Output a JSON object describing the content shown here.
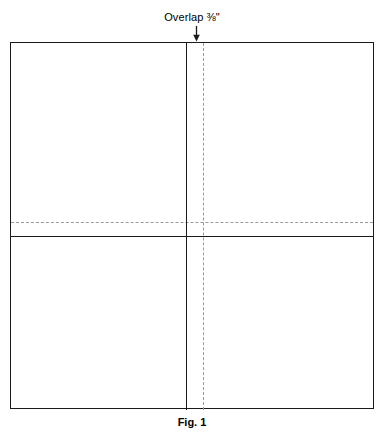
{
  "figure": {
    "caption": "Fig. 1",
    "callout": {
      "label_text": "Overlap",
      "measurement": "⅜\"",
      "full_label": "Overlap ⅜\"",
      "arrow_direction": "down"
    },
    "colors": {
      "outline": "#1a1a1a",
      "fold_line": "#1a1a1a",
      "overlap_line": "#9a9a9a",
      "background": "#ffffff",
      "text": "#000000"
    },
    "sheet": {
      "description": "rectangular sheet outline"
    },
    "lines": {
      "fold_vertical": "solid vertical fold line",
      "fold_horizontal": "solid horizontal fold line",
      "overlap_vertical": "dashed vertical overlap line",
      "overlap_horizontal": "dashed horizontal overlap line"
    }
  }
}
